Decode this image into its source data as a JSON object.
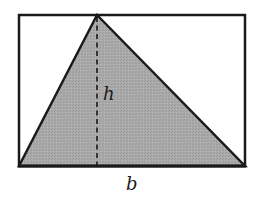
{
  "diagram": {
    "rectangle": {
      "x": 19,
      "y": 15,
      "width": 226,
      "height": 151,
      "stroke": "#1a1a1a",
      "fill": "#ffffff"
    },
    "triangle": {
      "points": [
        [
          19,
          166
        ],
        [
          97,
          15
        ],
        [
          245,
          166
        ]
      ],
      "fill": "#a6a6a6",
      "stroke": "#1a1a1a"
    },
    "height_line": {
      "x": 97,
      "y1": 15,
      "y2": 166,
      "style": "dashed",
      "color": "#1a1a1a"
    },
    "labels": {
      "height": "h",
      "base": "b"
    }
  }
}
